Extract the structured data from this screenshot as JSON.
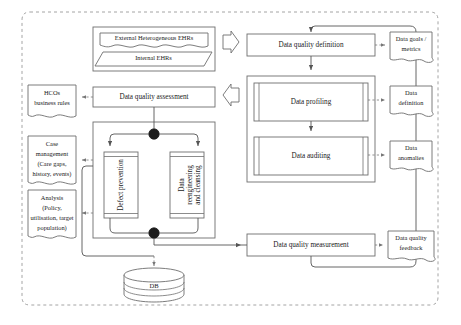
{
  "diagram": {
    "colors": {
      "stroke": "#6e6e6e",
      "connector": "#555555",
      "dashed_frame": "#9a9a9a",
      "junction": "#1c1c1c",
      "text": "#1a1a1a",
      "background": "#ffffff"
    },
    "sources": {
      "external_ehrs": "External Heterogeneous EHRs",
      "internal_ehrs": "Internal EHRs"
    },
    "assessment": {
      "header": "Data quality assessment",
      "defect_prevention": "Defect prevention",
      "data_reengineering": "Data reengineering and cleansing"
    },
    "right_flow": {
      "definition": "Data quality definition",
      "profiling": "Data profiling",
      "auditing": "Data auditing",
      "measurement": "Data quality measurement"
    },
    "left_notes": [
      {
        "id": "hcos-business-rules",
        "lines": [
          "HCOs",
          "business rules"
        ]
      },
      {
        "id": "case-management",
        "lines": [
          "Case",
          "management",
          "(Care gaps,",
          "history, events)"
        ]
      },
      {
        "id": "analysis",
        "lines": [
          "Analysis",
          "(Policy,",
          "utilisation, target",
          "population)"
        ]
      }
    ],
    "right_notes": [
      {
        "id": "data-goals-metrics",
        "lines": [
          "Data goals /",
          "metrics"
        ]
      },
      {
        "id": "data-definition",
        "lines": [
          "Data",
          "definition"
        ]
      },
      {
        "id": "data-anomalies",
        "lines": [
          "Data",
          "anomalies"
        ]
      },
      {
        "id": "data-quality-feedback",
        "lines": [
          "Data quality",
          "feedback"
        ]
      }
    ],
    "database": {
      "label": "DB"
    },
    "icons": {
      "chevron_right": "chevron-right-arrow",
      "chevron_left": "chevron-left-arrow",
      "junction_node": "junction-dot"
    }
  }
}
